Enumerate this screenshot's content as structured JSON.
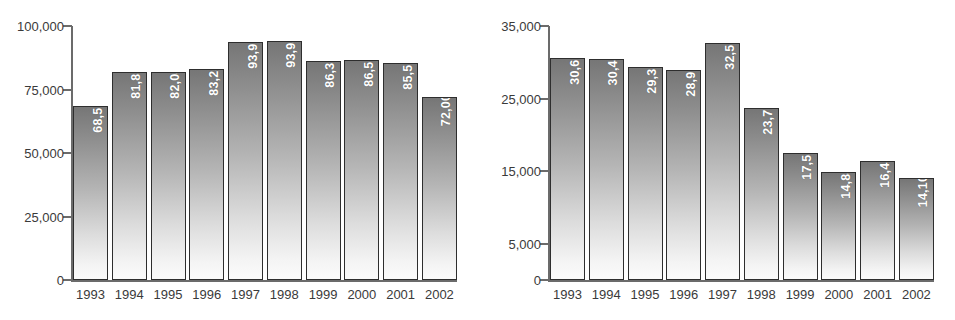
{
  "chart_data": [
    {
      "id": "left",
      "type": "bar",
      "title": "",
      "xlabel": "",
      "ylabel": "",
      "ylim": [
        0,
        100000
      ],
      "grid": false,
      "legend": "none",
      "ytick_labels": [
        "100,000",
        "75,000",
        "50,000",
        "25,000",
        "0"
      ],
      "ytick_values": [
        100000,
        75000,
        50000,
        25000,
        0
      ],
      "categories": [
        "1993",
        "1994",
        "1995",
        "1996",
        "1997",
        "1998",
        "1999",
        "2000",
        "2001",
        "2002"
      ],
      "values": [
        68587,
        81833,
        82041,
        83233,
        93901,
        93932,
        86316,
        86528,
        85581,
        72000
      ],
      "data_labels": [
        "68,587",
        "81,833",
        "82,041",
        "83,233",
        "93,901",
        "93,932",
        "86,316",
        "86,528",
        "85,581",
        "72,000*"
      ]
    },
    {
      "id": "right",
      "type": "bar",
      "title": "",
      "xlabel": "",
      "ylabel": "",
      "ylim": [
        0,
        35000
      ],
      "grid": false,
      "legend": "none",
      "ytick_labels": [
        "35,000",
        "25,000",
        "15,000",
        "5,000",
        "0"
      ],
      "ytick_values": [
        35000,
        25000,
        15000,
        5000,
        0
      ],
      "categories": [
        "1993",
        "1994",
        "1995",
        "1996",
        "1997",
        "1998",
        "1999",
        "2000",
        "2001",
        "2002"
      ],
      "values": [
        30650,
        30411,
        29314,
        28983,
        32596,
        23728,
        17532,
        14844,
        16465,
        14100
      ],
      "data_labels": [
        "30,650",
        "30,411",
        "29,314",
        "28,983",
        "32,596",
        "23,728",
        "17,532",
        "14,844",
        "16,465",
        "14,100*"
      ]
    }
  ],
  "colors": {
    "bar_gradient_top": "#767676",
    "bar_gradient_bottom": "#fbfbfb",
    "bar_border": "#2e2e2e",
    "axis": "#6b6b6b",
    "tick_text": "#3a3a3a",
    "data_label_text": "#ffffff",
    "background": "#ffffff"
  }
}
